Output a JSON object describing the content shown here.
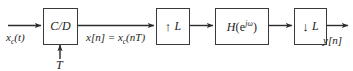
{
  "diagram": {
    "type": "block-diagram",
    "background_color": "#ffffff",
    "line_color": "#3a3a3a",
    "text_color": "#1d1d1d",
    "width": 353,
    "height": 71
  },
  "signals": {
    "input_continuous": "x",
    "input_continuous_sub": "c",
    "input_continuous_arg": "(t)",
    "sampled": "x",
    "sampled_brackets": "[n] = ",
    "sampled_x": "x",
    "sampled_sub": "c",
    "sampled_arg": "(nT)",
    "sampling_period": "T",
    "output": "y",
    "output_brackets": "[n]"
  },
  "blocks": [
    {
      "name": "cd-converter",
      "label": "C/D",
      "kind": "continuous-to-discrete"
    },
    {
      "name": "upsampler",
      "arrow": "↑",
      "factor": "L",
      "kind": "expander"
    },
    {
      "name": "filter",
      "label_h": "H",
      "label_open": "(e",
      "label_exp": "jω",
      "label_close": ")",
      "kind": "lti-filter"
    },
    {
      "name": "downsampler",
      "arrow": "↓",
      "factor": "L",
      "kind": "compressor"
    }
  ]
}
